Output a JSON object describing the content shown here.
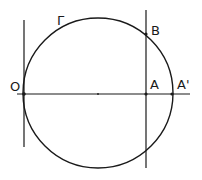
{
  "diagram": {
    "type": "geometry",
    "stroke_color": "#1a1a1a",
    "background": "#ffffff",
    "circle": {
      "label": "Γ",
      "cx": 98,
      "cy": 93,
      "r": 75
    },
    "horizontal_axis": {
      "x1": 17,
      "y1": 94,
      "x2": 190,
      "y2": 94
    },
    "left_vertical": {
      "x1": 24,
      "y1": 20,
      "x2": 24,
      "y2": 147
    },
    "right_vertical": {
      "x1": 146,
      "y1": 10,
      "x2": 146,
      "y2": 168
    },
    "points": [
      {
        "name": "O",
        "x": 24,
        "y": 94
      },
      {
        "name": "A",
        "x": 146,
        "y": 94
      },
      {
        "name": "A'",
        "x": 172,
        "y": 94
      },
      {
        "name": "B",
        "x": 146,
        "y": 34
      }
    ],
    "labels": {
      "O": "O",
      "A": "A",
      "A_prime": "A'",
      "B": "B",
      "gamma": "Γ"
    }
  }
}
